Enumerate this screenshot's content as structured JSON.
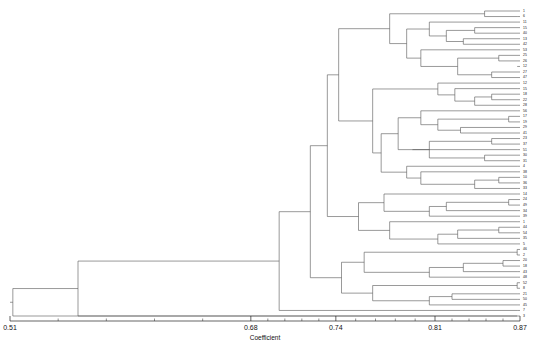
{
  "chart_data": {
    "type": "dendrogram",
    "title": "",
    "xlabel": "Coefficient",
    "ylabel": "",
    "xlim": [
      0.51,
      0.87
    ],
    "grid": false,
    "legend": "none",
    "orientation": "horizontal-right-leaves",
    "line_color": "#555555",
    "axis_color": "#222222",
    "tick_labels": [
      "0.51",
      "0.68",
      "0.74",
      "0.81",
      "0.87"
    ],
    "tick_values": [
      0.51,
      0.68,
      0.74,
      0.81,
      0.87
    ],
    "minor_ticks_per_interval": 4,
    "n_leaves": 56,
    "leaf_labels": [
      "1",
      "6",
      "11",
      "15",
      "40",
      "13",
      "42",
      "53",
      "25",
      "26",
      "12",
      "27",
      "47",
      "12",
      "15",
      "18",
      "22",
      "28",
      "56",
      "17",
      "19",
      "29",
      "41",
      "23",
      "37",
      "51",
      "30",
      "31",
      "4",
      "38",
      "10",
      "36",
      "33",
      "14",
      "24",
      "49",
      "34",
      "39",
      "1",
      "44",
      "54",
      "35",
      "5",
      "46",
      "2",
      "20",
      "18",
      "43",
      "48",
      "52",
      "8",
      "21",
      "50",
      "45",
      "7",
      "3"
    ],
    "leaf_merge_heights": [
      0.845,
      0.868,
      0.868,
      0.838,
      0.838,
      0.83,
      0.83,
      0.868,
      0.855,
      0.855,
      0.868,
      0.85,
      0.85,
      0.868,
      0.868,
      0.85,
      0.85,
      0.868,
      0.868,
      0.862,
      0.862,
      0.828,
      0.828,
      0.85,
      0.85,
      0.868,
      0.845,
      0.845,
      0.868,
      0.868,
      0.855,
      0.855,
      0.868,
      0.868,
      0.862,
      0.862,
      0.868,
      0.868,
      0.868,
      0.855,
      0.855,
      0.868,
      0.868,
      0.868,
      0.868,
      0.858,
      0.858,
      0.868,
      0.868,
      0.868,
      0.868,
      0.868,
      0.868,
      0.868,
      0.868,
      0.868
    ]
  },
  "axis": {
    "title": "Coefficient",
    "ticks": [
      {
        "label": "0.51",
        "value": 0.51
      },
      {
        "label": "0.68",
        "value": 0.68
      },
      {
        "label": "0.74",
        "value": 0.74
      },
      {
        "label": "0.81",
        "value": 0.81
      },
      {
        "label": "0.87",
        "value": 0.87
      }
    ]
  },
  "colors": {
    "background": "#ffffff",
    "line": "#555555",
    "axis": "#222222",
    "text": "#111111"
  }
}
